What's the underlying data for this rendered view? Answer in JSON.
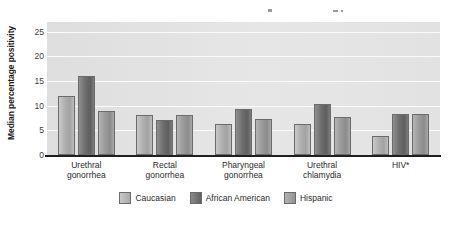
{
  "chart_data": {
    "type": "bar",
    "title": "",
    "xlabel": "",
    "ylabel": "Median percentage positivity",
    "ylim": [
      0,
      27
    ],
    "yticks": [
      0,
      5,
      10,
      15,
      20,
      25
    ],
    "grid": true,
    "legend_position": "bottom-center",
    "categories": [
      "Urethral gonorrhea",
      "Rectal gonorrhea",
      "Pharyngeal gonorrhea",
      "Urethral chlamydia",
      "HIV*"
    ],
    "category_lines": [
      [
        "Urethral",
        "gonorrhea"
      ],
      [
        "Rectal",
        "gonorrhea"
      ],
      [
        "Pharyngeal",
        "gonorrhea"
      ],
      [
        "Urethral",
        "chlamydia"
      ],
      [
        "HIV*"
      ]
    ],
    "series": [
      {
        "name": "Caucasian",
        "color": "#b0b0b0",
        "values": [
          12.0,
          8.2,
          6.2,
          6.3,
          3.9
        ]
      },
      {
        "name": "African American",
        "color": "#6a6a6a",
        "values": [
          16.0,
          7.2,
          9.4,
          10.3,
          8.4
        ]
      },
      {
        "name": "Hispanic",
        "color": "#9a9a9a",
        "values": [
          8.9,
          8.2,
          7.4,
          7.8,
          8.4
        ]
      }
    ]
  },
  "legend": {
    "items": [
      {
        "label": "Caucasian"
      },
      {
        "label": "African American"
      },
      {
        "label": "Hispanic"
      }
    ]
  },
  "axis": {
    "y_title": "Median percentage positivity"
  }
}
